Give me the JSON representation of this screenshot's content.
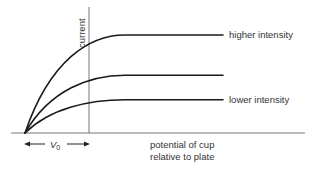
{
  "figure": {
    "y_axis_label": "current",
    "x_axis_label_line1": "potential of cup",
    "x_axis_label_line2": "relative to plate",
    "v0_label": "V",
    "v0_subscript": "0",
    "curves": [
      {
        "name": "higher intensity",
        "label": "higher intensity",
        "relative_saturation": 1.0,
        "labelled": true
      },
      {
        "name": "medium intensity",
        "label": "",
        "relative_saturation": 0.59,
        "labelled": false
      },
      {
        "name": "lower intensity",
        "label": "lower intensity",
        "relative_saturation": 0.34,
        "labelled": true
      }
    ],
    "colors": {
      "curve": "#1a1a1a",
      "axis": "#777777",
      "text": "#333333"
    }
  }
}
